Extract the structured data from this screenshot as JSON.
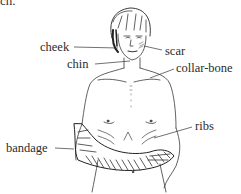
{
  "figure": {
    "type": "labeled-illustration",
    "top_fragment": "ch.",
    "labels": [
      {
        "id": "cheek",
        "text": "cheek"
      },
      {
        "id": "scar",
        "text": "scar"
      },
      {
        "id": "chin",
        "text": "chin"
      },
      {
        "id": "collar-bone",
        "text": "collar-bone"
      },
      {
        "id": "ribs",
        "text": "ribs"
      },
      {
        "id": "bandage",
        "text": "bandage"
      }
    ]
  }
}
